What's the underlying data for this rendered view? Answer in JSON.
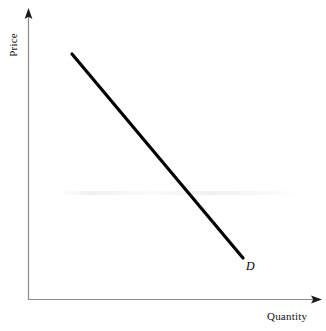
{
  "figure": {
    "title": "",
    "background_color": "#ffffff",
    "width": 326,
    "height": 331
  },
  "axes": {
    "y_label": "Price",
    "x_label": "Quantity",
    "axis_color": "#8a8a8a",
    "arrowhead_color": "#1a1a1a",
    "origin": {
      "x": 28,
      "y": 300
    },
    "y_axis_top": {
      "x": 28,
      "y": 10
    },
    "x_axis_right": {
      "x": 321,
      "y": 300
    }
  },
  "curve": {
    "label": "D",
    "name": "demand-curve",
    "color": "#000000",
    "width": 3,
    "start": {
      "x": 72,
      "y": 54
    },
    "end": {
      "x": 243,
      "y": 258
    }
  },
  "chart_data": {
    "type": "line",
    "title": "",
    "xlabel": "Quantity",
    "ylabel": "Price",
    "grid": false,
    "legend_position": "inline-end-label",
    "xlim": [
      0,
      100
    ],
    "ylim": [
      0,
      100
    ],
    "axis_ticks": {
      "x": [],
      "y": []
    },
    "series": [
      {
        "name": "D",
        "description": "Downward-sloping demand curve",
        "x": [
          15,
          73
        ],
        "y": [
          85,
          14
        ]
      }
    ],
    "annotations": [
      {
        "text": "D",
        "x": 75,
        "y": 12,
        "style": "italic"
      }
    ]
  }
}
